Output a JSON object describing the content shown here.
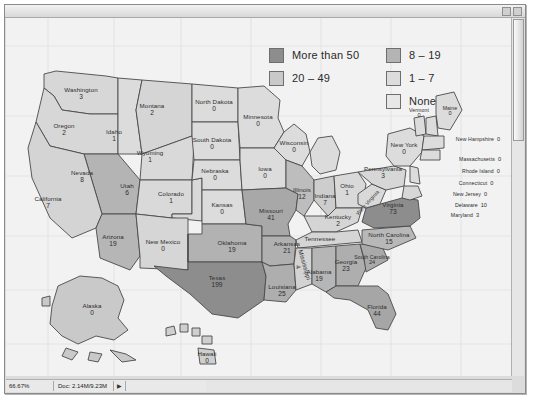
{
  "window": {
    "title": "",
    "titlebar_buttons": [
      "minimize-box",
      "maximize-box"
    ],
    "status": {
      "zoom": "66.67%",
      "doc_info": "Doc: 2.14M/9.23M",
      "arrow": "▶"
    }
  },
  "legend": {
    "columns": [
      [
        {
          "label": "More than 50",
          "color": "#8d8d8d"
        },
        {
          "label": "20 – 49",
          "color": "#c9c9c9"
        }
      ],
      [
        {
          "label": "8 – 19",
          "color": "#b4b4b4"
        },
        {
          "label": "1 – 7",
          "color": "#dcdcdc"
        },
        {
          "label": "None",
          "color": "#e7e7e7"
        }
      ]
    ]
  },
  "map": {
    "background": "#f2f2f2",
    "grid_color": "#e2e2e2",
    "outline_color": "#4a4a4a",
    "states": [
      {
        "name": "Washington",
        "value": "3",
        "x": 75,
        "y": 76,
        "fill": "#d7d7d7"
      },
      {
        "name": "Oregon",
        "value": "2",
        "x": 58,
        "y": 112,
        "fill": "#d7d7d7"
      },
      {
        "name": "Idaho",
        "value": "1",
        "x": 108,
        "y": 118,
        "fill": "#dcdcdc"
      },
      {
        "name": "Montana",
        "value": "2",
        "x": 146,
        "y": 92,
        "fill": "#d5d5d5"
      },
      {
        "name": "Wyoming",
        "value": "1",
        "x": 144,
        "y": 139,
        "fill": "#d9d9d9"
      },
      {
        "name": "Nevada",
        "value": "8",
        "x": 76,
        "y": 159,
        "fill": "#b4b4b4"
      },
      {
        "name": "Utah",
        "value": "6",
        "x": 121,
        "y": 172,
        "fill": "#d9d9d9"
      },
      {
        "name": "Colorado",
        "value": "1",
        "x": 165,
        "y": 180,
        "fill": "#d9d9d9"
      },
      {
        "name": "California",
        "value": "7",
        "x": 42,
        "y": 185,
        "fill": "#d4d4d4"
      },
      {
        "name": "Arizona",
        "value": "19",
        "x": 107,
        "y": 223,
        "fill": "#b6b6b6"
      },
      {
        "name": "New Mexico",
        "value": "0",
        "x": 157,
        "y": 228,
        "fill": "#d6d6d6"
      },
      {
        "name": "North Dakota",
        "value": "0",
        "x": 208,
        "y": 88,
        "fill": "#dcdcdc"
      },
      {
        "name": "South Dakota",
        "value": "0",
        "x": 206,
        "y": 126,
        "fill": "#dcdcdc"
      },
      {
        "name": "Nebraska",
        "value": "0",
        "x": 209,
        "y": 157,
        "fill": "#dcdcdc"
      },
      {
        "name": "Kansas",
        "value": "0",
        "x": 216,
        "y": 191,
        "fill": "#dcdcdc"
      },
      {
        "name": "Oklahoma",
        "value": "19",
        "x": 226,
        "y": 229,
        "fill": "#b2b2b2"
      },
      {
        "name": "Texas",
        "value": "199",
        "x": 211,
        "y": 264,
        "fill": "#8d8d8d"
      },
      {
        "name": "Minnesota",
        "value": "0",
        "x": 252,
        "y": 103,
        "fill": "#dcdcdc"
      },
      {
        "name": "Iowa",
        "value": "0",
        "x": 259,
        "y": 155,
        "fill": "#dcdcdc"
      },
      {
        "name": "Missouri",
        "value": "41",
        "x": 265,
        "y": 197,
        "fill": "#a8a8a8"
      },
      {
        "name": "Arkansas",
        "value": "21",
        "x": 281,
        "y": 230,
        "fill": "#b0b0b0"
      },
      {
        "name": "Louisiana",
        "value": "25",
        "x": 276,
        "y": 273,
        "fill": "#aeaeae"
      },
      {
        "name": "Wisconsin",
        "value": "0",
        "x": 288,
        "y": 129,
        "fill": "#dcdcdc"
      },
      {
        "name": "Illinois",
        "value": "12",
        "x": 296,
        "y": 176,
        "fill": "#bdbdbd"
      },
      {
        "name": "Indiana",
        "value": "7",
        "x": 319,
        "y": 182,
        "fill": "#cdcdcd"
      },
      {
        "name": "Ohio",
        "value": "1",
        "x": 341,
        "y": 172,
        "fill": "#d9d9d9"
      },
      {
        "name": "Kentucky",
        "value": "2",
        "x": 332,
        "y": 203,
        "fill": "#d5d5d5"
      },
      {
        "name": "Tennessee",
        "value": "",
        "x": 314,
        "y": 221,
        "fill": "#d5d5d5"
      },
      {
        "name": "Mississippi",
        "value": "4",
        "x": 295,
        "y": 248,
        "fill": "#d3d3d3",
        "rotate": "rot"
      },
      {
        "name": "Alabama",
        "value": "19",
        "x": 313,
        "y": 258,
        "fill": "#b6b6b6"
      },
      {
        "name": "Georgia",
        "value": "23",
        "x": 340,
        "y": 248,
        "fill": "#aeaeae"
      },
      {
        "name": "Florida",
        "value": "44",
        "x": 371,
        "y": 293,
        "fill": "#a6a6a6"
      },
      {
        "name": "South Carolina",
        "value": "24",
        "x": 366,
        "y": 243,
        "fill": "#a9a9a9",
        "small": true
      },
      {
        "name": "North Carolina",
        "value": "15",
        "x": 383,
        "y": 221,
        "fill": "#b8b8b8"
      },
      {
        "name": "Virginia",
        "value": "73",
        "x": 387,
        "y": 191,
        "fill": "#8d8d8d"
      },
      {
        "name": "West Virginia",
        "value": "",
        "x": 362,
        "y": 185,
        "fill": "#d9d9d9",
        "rotate": "rot2",
        "small": true
      },
      {
        "name": "Pennsylvania",
        "value": "3",
        "x": 377,
        "y": 155,
        "fill": "#d7d7d7"
      },
      {
        "name": "New York",
        "value": "0",
        "x": 398,
        "y": 131,
        "fill": "#dcdcdc"
      },
      {
        "name": "Vermont",
        "value": "0",
        "x": 413,
        "y": 96,
        "fill": "#dcdcdc",
        "small": true
      },
      {
        "name": "Maine",
        "value": "0",
        "x": 444,
        "y": 94,
        "fill": "#dcdcdc",
        "small": true
      },
      {
        "name": "Alaska",
        "value": "0",
        "x": 86,
        "y": 292,
        "fill": "#c9c9c9"
      },
      {
        "name": "Hawaii",
        "value": "0",
        "x": 201,
        "y": 340,
        "fill": "#cfcfcf"
      }
    ],
    "callouts": [
      {
        "name": "New Hampshire",
        "value": "0",
        "x": 472,
        "y": 118
      },
      {
        "name": "Massachusetts",
        "value": "0",
        "x": 474,
        "y": 138
      },
      {
        "name": "Rhode Island",
        "value": "0",
        "x": 475,
        "y": 150
      },
      {
        "name": "Connecticut",
        "value": "0",
        "x": 470,
        "y": 162
      },
      {
        "name": "New Jersey",
        "value": "0",
        "x": 464,
        "y": 173
      },
      {
        "name": "Delaware",
        "value": "10",
        "x": 465,
        "y": 184
      },
      {
        "name": "Maryland",
        "value": "3",
        "x": 459,
        "y": 194
      }
    ]
  }
}
